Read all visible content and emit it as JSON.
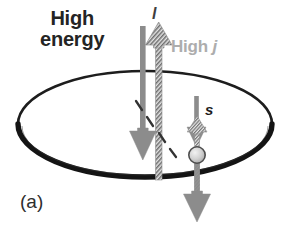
{
  "figure": {
    "panel_label": "(a)",
    "labels": {
      "high_energy": "High\nenergy",
      "high_j_prefix": "High ",
      "high_j_symbol": "j",
      "orbital_symbol": "l",
      "spin_symbol": "s"
    },
    "colors": {
      "text_dark": "#242424",
      "text_gray": "#adadad",
      "orbit_ring": "#1a1a1a",
      "arrow_gray": "#8a8a8a",
      "arrow_hatched_dark": "#5a5a5a",
      "arrow_hatched_light": "#d8d8d8",
      "electron_fill": "#cfcfcf",
      "electron_stroke": "#4a4a4a",
      "dashed_line": "#3a3a3a",
      "background": "#ffffff"
    },
    "elements": {
      "orbit_ring": "ellipse",
      "orbital_angular_momentum_arrow": "solid-gray-down-arrow",
      "total_angular_momentum_arrow": "hatched-up-arrow",
      "spin_up_arrow": "hatched-up-arrow-small",
      "spin_down_arrow": "solid-gray-down-arrow-small",
      "spin_hatched_down": "hatched-down-line",
      "precession_dashes": "diagonal-dashed-line",
      "electron": "circle-on-ring"
    }
  }
}
